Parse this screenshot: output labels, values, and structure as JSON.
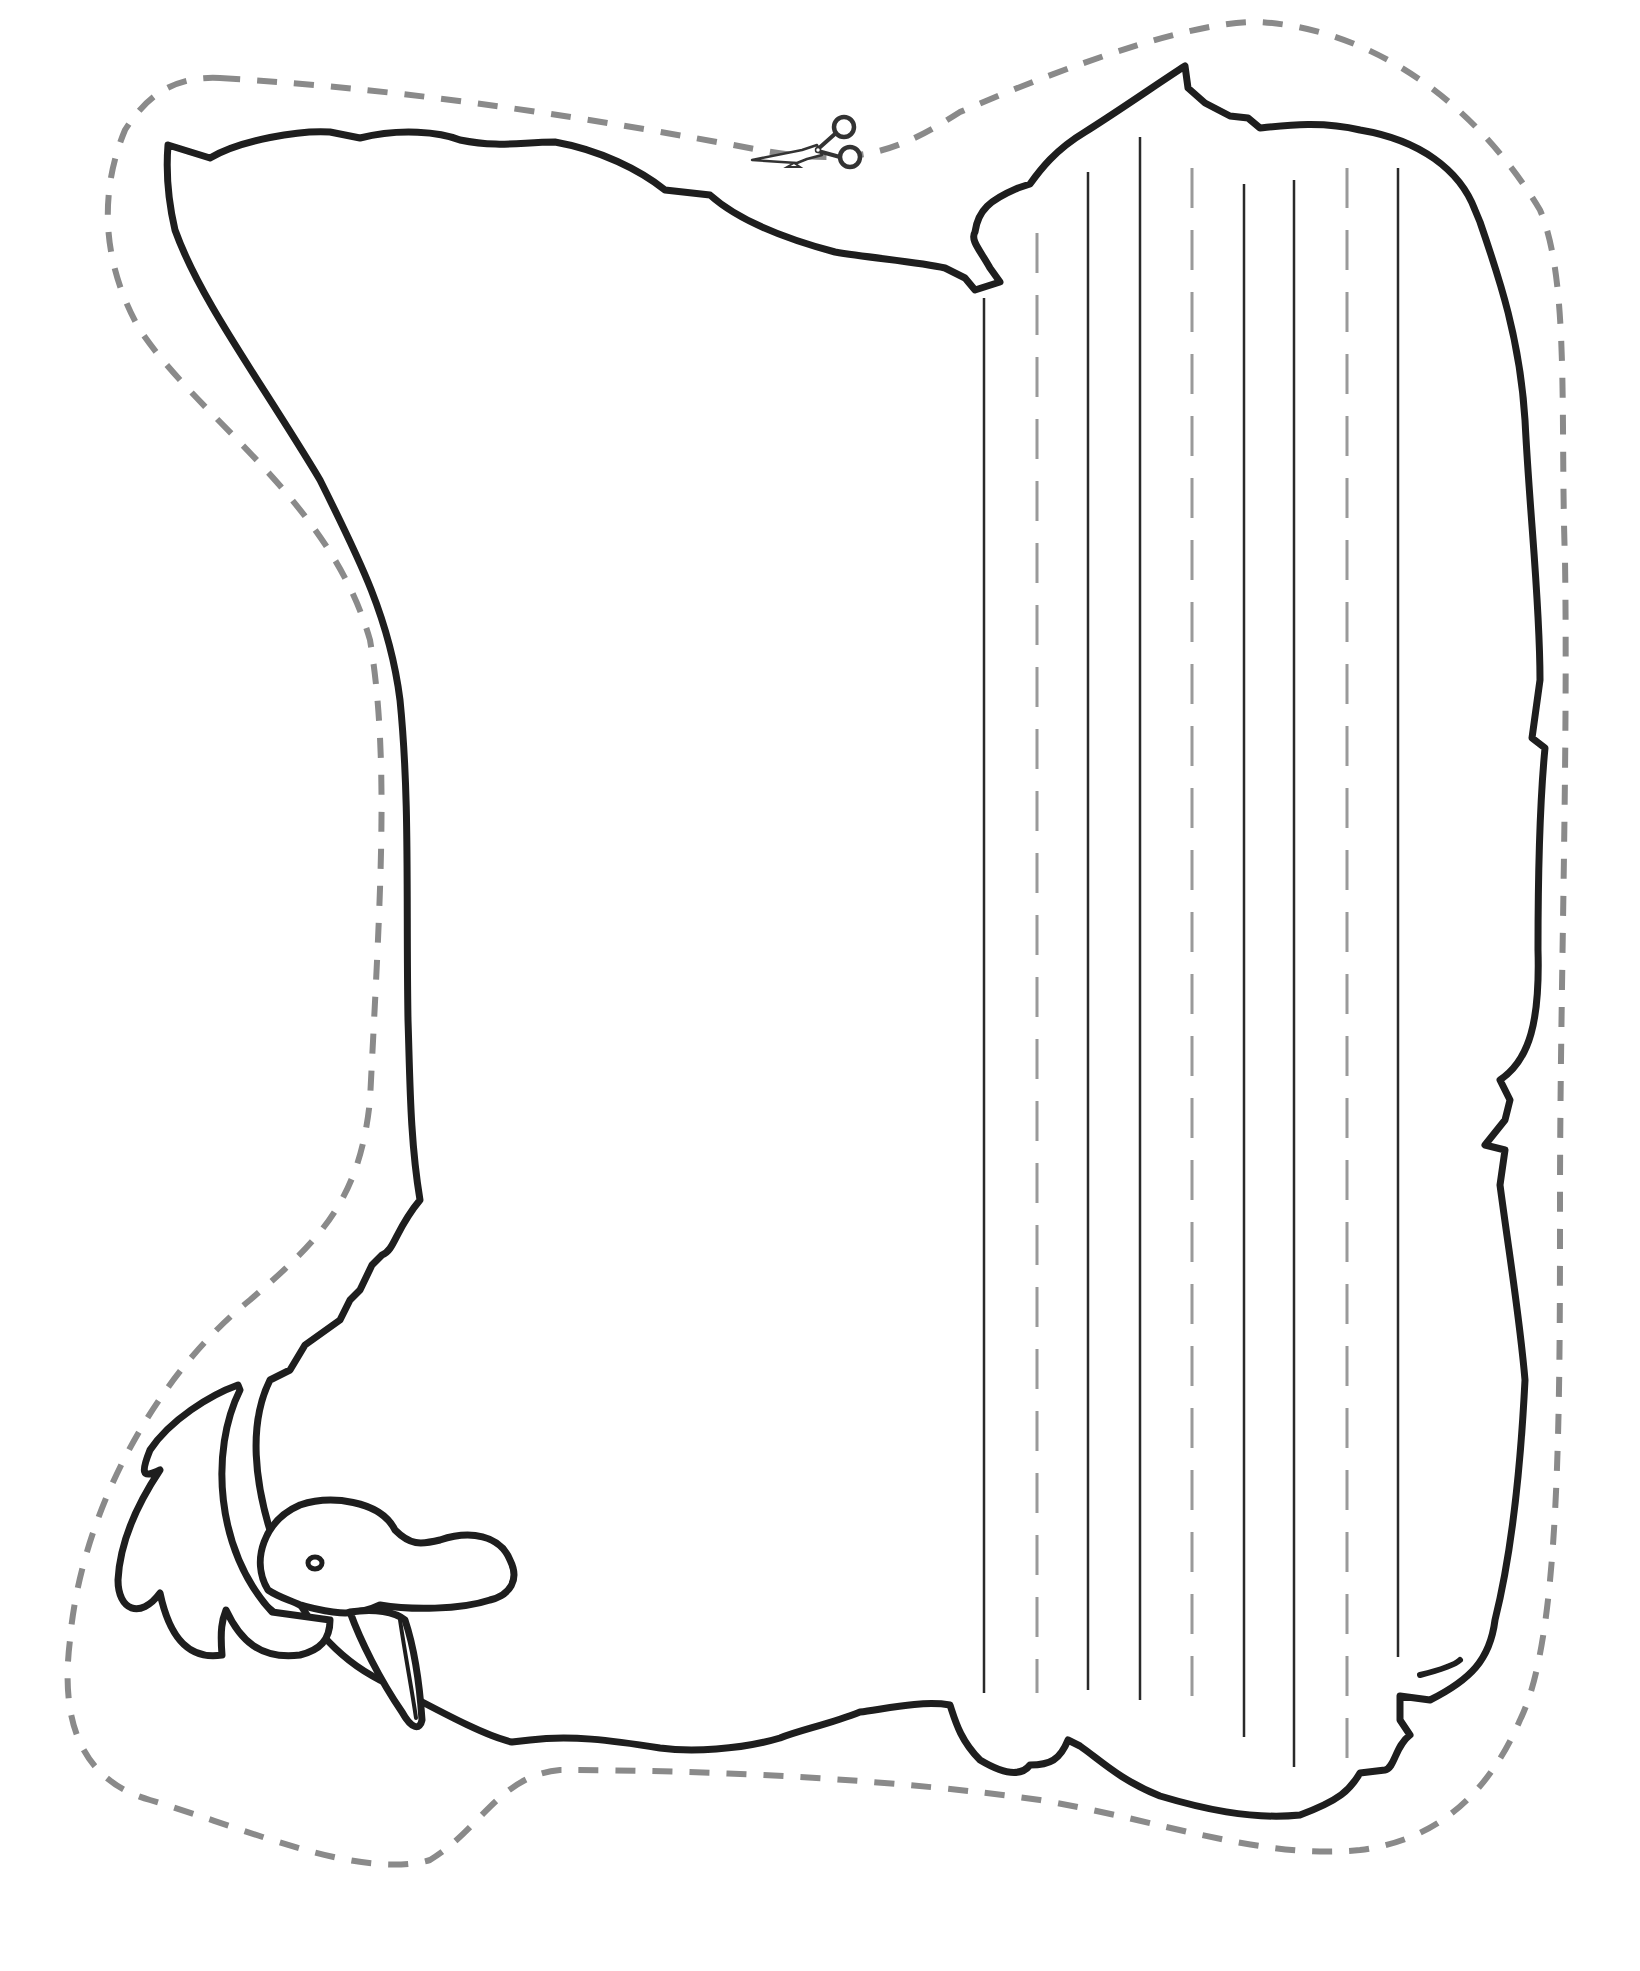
{
  "document": {
    "type": "printable writing template",
    "shape": "chicken (hen) silhouette",
    "orientation": "hen facing left, head at bottom-left"
  },
  "cut_line": {
    "style": "dashed",
    "color": "#8a8a8a",
    "icon": "scissors-icon"
  },
  "outline": {
    "color": "#1e1e1e"
  },
  "writing_lines": {
    "orientation": "vertical",
    "pattern": [
      "solid",
      "dashed",
      "solid",
      "solid",
      "dashed",
      "solid",
      "solid",
      "dashed",
      "solid"
    ],
    "solid_color": "#2a2a2a",
    "dashed_color": "#9a9a9a",
    "x_positions": [
      984,
      1037,
      1088,
      1140,
      1192,
      1244,
      1294,
      1347,
      1398
    ]
  },
  "colors": {
    "background": "#ffffff",
    "outline": "#1e1e1e",
    "cut_line": "#8a8a8a"
  }
}
